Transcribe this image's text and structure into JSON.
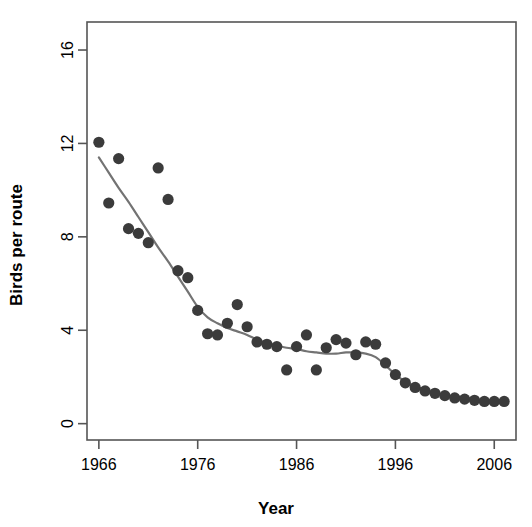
{
  "chart_data": {
    "type": "scatter",
    "title": "",
    "xlabel": "Year",
    "ylabel": "Birds per route",
    "xlim": [
      1964.8,
      2008.2
    ],
    "ylim": [
      -0.7,
      17.2
    ],
    "xticks": [
      1966,
      1976,
      1986,
      1996,
      2006
    ],
    "xticklabels": [
      "1966",
      "1976",
      "1986",
      "1996",
      "2006"
    ],
    "yticks": [
      0,
      4,
      8,
      12,
      16
    ],
    "yticklabels": [
      "0",
      "4",
      "8",
      "12",
      "16"
    ],
    "grid": false,
    "legend": null,
    "point_color": "#3b3b3b",
    "line_color": "#737373",
    "axis_color": "#555555",
    "background": "#ffffff",
    "series": [
      {
        "name": "Observed birds per route",
        "type": "scatter",
        "marker": "filled-circle",
        "x": [
          1966,
          1967,
          1968,
          1969,
          1970,
          1971,
          1972,
          1973,
          1974,
          1975,
          1976,
          1977,
          1978,
          1979,
          1980,
          1981,
          1982,
          1983,
          1984,
          1985,
          1986,
          1987,
          1988,
          1989,
          1990,
          1991,
          1992,
          1993,
          1994,
          1995,
          1996,
          1997,
          1998,
          1999,
          2000,
          2001,
          2002,
          2003,
          2004,
          2005,
          2006,
          2007
        ],
        "y": [
          12.05,
          9.45,
          11.35,
          8.35,
          8.15,
          7.75,
          10.95,
          9.6,
          6.55,
          6.25,
          4.85,
          3.85,
          3.8,
          4.3,
          5.1,
          4.15,
          3.5,
          3.4,
          3.3,
          2.3,
          3.3,
          3.8,
          2.3,
          3.25,
          3.6,
          3.45,
          2.95,
          3.5,
          3.4,
          2.6,
          2.1,
          1.75,
          1.55,
          1.4,
          1.3,
          1.2,
          1.1,
          1.05,
          1.0,
          0.95,
          0.95,
          0.95
        ]
      },
      {
        "name": "Smoothed trend",
        "type": "line",
        "x": [
          1966,
          1967,
          1968,
          1969,
          1970,
          1971,
          1972,
          1973,
          1974,
          1975,
          1976,
          1977,
          1978,
          1979,
          1980,
          1981,
          1982,
          1983,
          1984,
          1985,
          1986,
          1987,
          1988,
          1989,
          1990,
          1991,
          1992,
          1993,
          1994,
          1995,
          1996,
          1997,
          1998,
          1999,
          2000,
          2001,
          2002,
          2003,
          2004,
          2005,
          2006,
          2007
        ],
        "y": [
          11.4,
          10.75,
          10.1,
          9.5,
          8.85,
          8.2,
          7.55,
          6.95,
          6.3,
          5.65,
          5.0,
          4.55,
          4.3,
          4.1,
          3.95,
          3.8,
          3.6,
          3.45,
          3.35,
          3.25,
          3.2,
          3.1,
          3.05,
          3.0,
          3.0,
          3.05,
          3.05,
          3.0,
          2.85,
          2.5,
          2.1,
          1.8,
          1.6,
          1.45,
          1.3,
          1.2,
          1.1,
          1.05,
          1.0,
          0.95,
          0.95,
          0.9
        ]
      }
    ]
  }
}
